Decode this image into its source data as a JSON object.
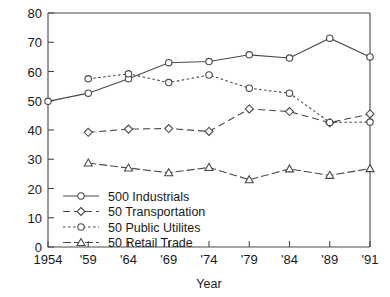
{
  "chart_data": {
    "type": "line",
    "title": "",
    "xlabel": "Year",
    "ylabel": "% Share",
    "x": [
      1954,
      1959,
      1964,
      1969,
      1974,
      1979,
      1984,
      1989,
      1991
    ],
    "xtick_labels": [
      "1954",
      "'59",
      "'64",
      "'69",
      "'74",
      "'79",
      "'84",
      "'89",
      "'91"
    ],
    "ytick_labels": [
      "0",
      "10",
      "20",
      "30",
      "40",
      "50",
      "60",
      "70",
      "80"
    ],
    "yticks": [
      0,
      10,
      20,
      30,
      40,
      50,
      60,
      70,
      80
    ],
    "ylim": [
      0,
      80
    ],
    "xlim": [
      1954,
      1991
    ],
    "grid": false,
    "legend_position": "lower-left-inside",
    "series": [
      {
        "name": "500 Industrials",
        "marker": "circle",
        "dash": "solid",
        "x": [
          1954,
          1959,
          1964,
          1969,
          1974,
          1979,
          1984,
          1989,
          1991
        ],
        "values": [
          49.8,
          52.6,
          57.5,
          63.0,
          63.4,
          65.7,
          64.6,
          71.4,
          65.0
        ]
      },
      {
        "name": "50 Transportation",
        "marker": "diamond",
        "dash": "dashed",
        "x": [
          1959,
          1964,
          1969,
          1974,
          1979,
          1984,
          1989,
          1991
        ],
        "values": [
          39.2,
          40.3,
          40.5,
          39.5,
          47.2,
          46.3,
          42.5,
          45.5
        ]
      },
      {
        "name": "50 Public Utilites",
        "marker": "circle",
        "dash": "dotted",
        "x": [
          1959,
          1964,
          1969,
          1974,
          1979,
          1984,
          1989,
          1991
        ],
        "values": [
          57.5,
          59.2,
          56.2,
          58.8,
          54.3,
          52.6,
          42.6,
          42.7
        ]
      },
      {
        "name": "50 Retail Trade",
        "marker": "triangle",
        "dash": "dashdot",
        "x": [
          1959,
          1964,
          1969,
          1974,
          1979,
          1984,
          1989,
          1991
        ],
        "values": [
          28.7,
          27.0,
          25.4,
          27.2,
          23.0,
          26.7,
          24.5,
          26.8
        ]
      }
    ],
    "colors": {
      "axis": "#4a4a4a",
      "series": "#4a4a4a",
      "marker_fill": "#ffffff",
      "background": "#ffffff"
    }
  }
}
